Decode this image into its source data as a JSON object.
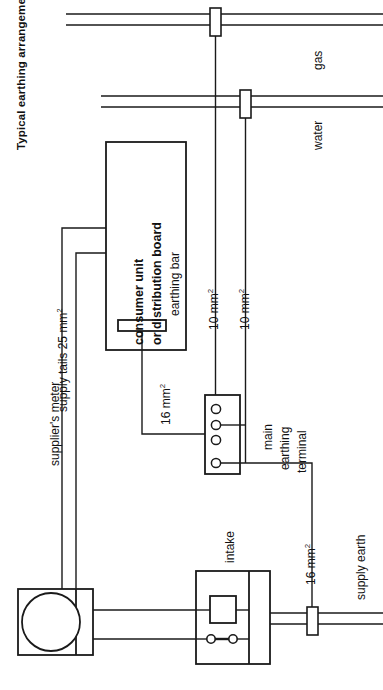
{
  "figure": {
    "title": "Typical earthing arrangements",
    "background": "#ffffff",
    "line_color": "#1a1a1a",
    "text_color": "#111111"
  },
  "services": {
    "gas": {
      "label": "gas",
      "clamp": "pipe-clamp"
    },
    "water": {
      "label": "water",
      "clamp": "pipe-clamp"
    },
    "supply_earth": {
      "label": "supply earth",
      "clamp": "pipe-clamp"
    }
  },
  "consumer_unit": {
    "line1": "consumer unit",
    "line2": "or distribution board",
    "line3": "earthing bar"
  },
  "main_terminal": {
    "line1": "main",
    "line2": "earthing",
    "line3": "terminal",
    "terminal_count": 4
  },
  "meter": {
    "label": "supplier's meter"
  },
  "intake": {
    "label": "intake"
  },
  "conductors": [
    {
      "id": "supply-tails",
      "label": "supply tails 25 mm",
      "sup": "2"
    },
    {
      "id": "gas-bond",
      "label": "10 mm",
      "sup": "2"
    },
    {
      "id": "water-bond",
      "label": "10 mm",
      "sup": "2"
    },
    {
      "id": "cu-earth",
      "label": "16 mm",
      "sup": "2"
    },
    {
      "id": "earth-lead",
      "label": "16 mm",
      "sup": "2"
    }
  ]
}
